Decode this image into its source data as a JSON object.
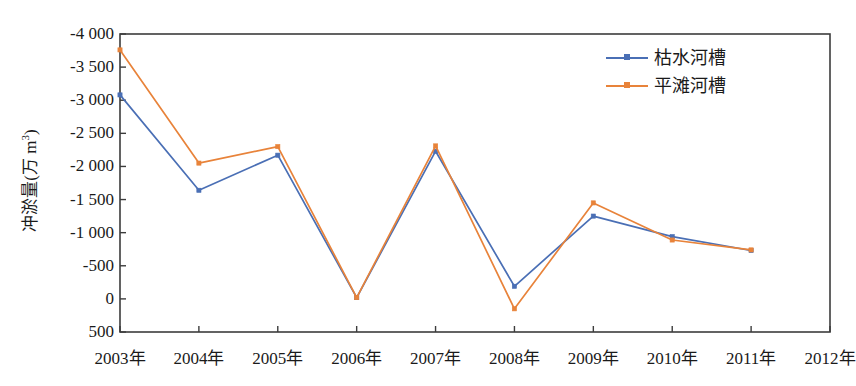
{
  "chart_data": {
    "type": "line",
    "title": "",
    "xlabel": "",
    "ylabel": "冲淤量(万 m³)",
    "ylabel_main": "冲淤量(万 m",
    "ylabel_sup": "3",
    "ylabel_close": ")",
    "categories": [
      "2003年",
      "2004年",
      "2005年",
      "2006年",
      "2007年",
      "2008年",
      "2009年",
      "2010年",
      "2011年",
      "2012年"
    ],
    "x_tick_labels": [
      "2003年",
      "2004年",
      "2005年",
      "2006年",
      "2007年",
      "2008年",
      "2009年",
      "2010年",
      "2011年",
      "2012年"
    ],
    "y_tick_labels": [
      "-4 000",
      "-3 500",
      "-3 000",
      "-2 500",
      "-2 000",
      "-1 500",
      "-1 000",
      "-500",
      "0",
      "500"
    ],
    "y_tick_values": [
      -4000,
      -3500,
      -3000,
      -2500,
      -2000,
      -1500,
      -1000,
      -500,
      0,
      500
    ],
    "ylim": [
      -4000,
      500
    ],
    "y_axis_inverted": true,
    "grid": false,
    "legend_position": "top-right",
    "series": [
      {
        "name": "枯水河槽",
        "color": "#4a6fb5",
        "x": [
          "2003年",
          "2004年",
          "2005年",
          "2006年",
          "2007年",
          "2008年",
          "2009年",
          "2010年",
          "2011年"
        ],
        "values": [
          -3080,
          -1640,
          -2170,
          -20,
          -2230,
          -190,
          -1250,
          -940,
          -730
        ]
      },
      {
        "name": "平滩河槽",
        "color": "#e8833a",
        "x": [
          "2003年",
          "2004年",
          "2005年",
          "2006年",
          "2007年",
          "2008年",
          "2009年",
          "2010年",
          "2011年"
        ],
        "values": [
          -3760,
          -2050,
          -2300,
          -20,
          -2310,
          150,
          -1450,
          -890,
          -740
        ]
      }
    ]
  },
  "legend": {
    "items": [
      {
        "label": "枯水河槽",
        "color": "#4a6fb5"
      },
      {
        "label": "平滩河槽",
        "color": "#e8833a"
      }
    ]
  },
  "axes": {
    "frame_color": "#3c3c3c"
  }
}
